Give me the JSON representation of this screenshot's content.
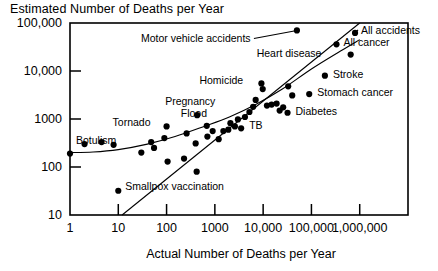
{
  "chart_data": {
    "type": "scatter",
    "title": "Estimated Number of Deaths per Year",
    "xlabel": "Actual Number of Deaths per Year",
    "ylabel": "Estimated Number of Deaths per Year",
    "xscale": "log",
    "yscale": "log",
    "xlim": [
      1,
      10000000
    ],
    "ylim": [
      10,
      100000
    ],
    "grid": false,
    "legend": null,
    "xticks": [
      {
        "value": 1,
        "label": "1"
      },
      {
        "value": 10,
        "label": "10"
      },
      {
        "value": 100,
        "label": "100"
      },
      {
        "value": 1000,
        "label": "1000"
      },
      {
        "value": 10000,
        "label": "10,000"
      },
      {
        "value": 100000,
        "label": "100,000"
      },
      {
        "value": 1000000,
        "label": "1,000,000"
      }
    ],
    "yticks": [
      {
        "value": 10,
        "label": "10"
      },
      {
        "value": 100,
        "label": "100"
      },
      {
        "value": 1000,
        "label": "1000"
      },
      {
        "value": 10000,
        "label": "10,000"
      },
      {
        "value": 100000,
        "label": "100,000"
      }
    ],
    "labeled_points": [
      {
        "name": "Botulism",
        "x": 1,
        "y": 190,
        "label": "Botulism",
        "label_dx": 6,
        "label_dy": -14,
        "leader": false
      },
      {
        "name": "Smallpox vaccination",
        "x": 10,
        "y": 32,
        "label": "Smallpox vaccination",
        "label_dx": 7,
        "label_dy": -5,
        "leader": false
      },
      {
        "name": "Tornado",
        "x": 100,
        "y": 700,
        "label": "Tornado",
        "label_dx": -48,
        "label_dy": -4,
        "leader": false
      },
      {
        "name": "Pregnancy",
        "x": 430,
        "y": 1200,
        "label": "Pregnancy",
        "label_dx": -26,
        "label_dy": -14,
        "leader": false
      },
      {
        "name": "Flood",
        "x": 680,
        "y": 720,
        "label": "Flood",
        "label_dx": -20,
        "label_dy": -13,
        "leader": false
      },
      {
        "name": "TB",
        "x": 3500,
        "y": 640,
        "label": "TB",
        "label_dx": 8,
        "label_dy": -3,
        "leader": false
      },
      {
        "name": "Homicide",
        "x": 9200,
        "y": 5500,
        "label": "Homicide",
        "label_dx": -56,
        "label_dy": -3,
        "leader": false
      },
      {
        "name": "Motor vehicle accidents",
        "x": 50000,
        "y": 70000,
        "label": "Motor vehicle accidents",
        "label_dx": -150,
        "label_dy": 8,
        "leader": true
      },
      {
        "name": "All accidents",
        "x": 800000,
        "y": 62000,
        "label": "All accidents",
        "label_dx": 6,
        "label_dy": -3,
        "leader": true
      },
      {
        "name": "All cancer",
        "x": 330000,
        "y": 36000,
        "label": "All cancer",
        "label_dx": 7,
        "label_dy": -2,
        "leader": false
      },
      {
        "name": "Heart disease",
        "x": 650000,
        "y": 22000,
        "label": "Heart disease",
        "label_dx": -88,
        "label_dy": -2,
        "leader": false
      },
      {
        "name": "Stroke",
        "x": 190000,
        "y": 8000,
        "label": "Stroke",
        "label_dx": 8,
        "label_dy": -2,
        "leader": false
      },
      {
        "name": "Stomach cancer",
        "x": 90000,
        "y": 3300,
        "label": "Stomach cancer",
        "label_dx": 8,
        "label_dy": -2,
        "leader": false
      },
      {
        "name": "Diabetes",
        "x": 32000,
        "y": 1350,
        "label": "Diabetes",
        "label_dx": 8,
        "label_dy": -2,
        "leader": false
      }
    ],
    "unlabeled_points": [
      {
        "x": 2,
        "y": 300
      },
      {
        "x": 4.5,
        "y": 330
      },
      {
        "x": 8,
        "y": 290
      },
      {
        "x": 30,
        "y": 200
      },
      {
        "x": 55,
        "y": 250
      },
      {
        "x": 48,
        "y": 330
      },
      {
        "x": 90,
        "y": 400
      },
      {
        "x": 105,
        "y": 130
      },
      {
        "x": 230,
        "y": 150
      },
      {
        "x": 260,
        "y": 500
      },
      {
        "x": 400,
        "y": 310
      },
      {
        "x": 420,
        "y": 80
      },
      {
        "x": 700,
        "y": 430
      },
      {
        "x": 900,
        "y": 560
      },
      {
        "x": 1200,
        "y": 380
      },
      {
        "x": 1500,
        "y": 560
      },
      {
        "x": 1900,
        "y": 600
      },
      {
        "x": 2100,
        "y": 820
      },
      {
        "x": 2600,
        "y": 700
      },
      {
        "x": 3000,
        "y": 980
      },
      {
        "x": 4200,
        "y": 1100
      },
      {
        "x": 5200,
        "y": 1400
      },
      {
        "x": 6200,
        "y": 1800
      },
      {
        "x": 7000,
        "y": 2500
      },
      {
        "x": 9800,
        "y": 4200
      },
      {
        "x": 12000,
        "y": 1900
      },
      {
        "x": 15000,
        "y": 2000
      },
      {
        "x": 19000,
        "y": 2100
      },
      {
        "x": 22000,
        "y": 1500
      },
      {
        "x": 26000,
        "y": 1750
      },
      {
        "x": 33000,
        "y": 4800
      },
      {
        "x": 40000,
        "y": 3100
      }
    ],
    "curves": [
      {
        "name": "fitted-regression-curve",
        "points": [
          [
            1,
            200
          ],
          [
            3,
            205
          ],
          [
            10,
            230
          ],
          [
            40,
            300
          ],
          [
            150,
            430
          ],
          [
            600,
            700
          ],
          [
            2000,
            1100
          ],
          [
            7000,
            2000
          ],
          [
            25000,
            4200
          ],
          [
            100000,
            11000
          ],
          [
            400000,
            26000
          ],
          [
            1000000,
            45000
          ]
        ]
      },
      {
        "name": "identity-line",
        "points": [
          [
            12,
            10
          ],
          [
            1000000,
            100000
          ]
        ]
      }
    ]
  },
  "axes": {
    "title": "Estimated Number of Deaths per Year",
    "xlabel": "Actual Number of Deaths per Year"
  }
}
